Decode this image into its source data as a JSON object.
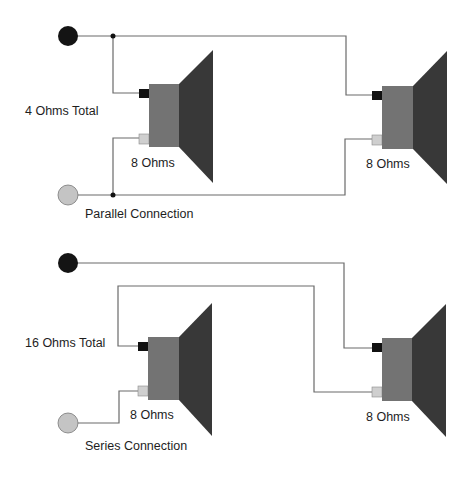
{
  "colors": {
    "wire": "#6a6a6a",
    "positive_terminal": "#111111",
    "negative_terminal": "#cfcfcf",
    "positive_jack": "#141414",
    "negative_jack": "#c4c4c4",
    "magnet": "#737373",
    "cone": "#383838",
    "junction": "#111111",
    "text": "#1e1e1e"
  },
  "parallel": {
    "total_label": "4 Ohms Total",
    "caption": "Parallel Connection",
    "speakers": [
      {
        "impedance_label": "8 Ohms"
      },
      {
        "impedance_label": "8 Ohms"
      }
    ]
  },
  "series": {
    "total_label": "16 Ohms Total",
    "caption": "Series Connection",
    "speakers": [
      {
        "impedance_label": "8 Ohms"
      },
      {
        "impedance_label": "8 Ohms"
      }
    ]
  }
}
